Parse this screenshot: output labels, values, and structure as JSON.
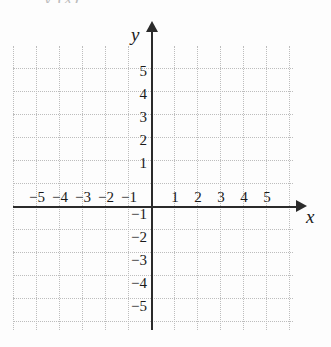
{
  "figure": {
    "type": "coordinate-grid",
    "width": 331,
    "height": 347,
    "background_color": "#fdfdfd",
    "grid_color": "#bdbdbd",
    "axis_color": "#2b2b2b",
    "top_fragment_text": "y (x)"
  },
  "axes": {
    "x_name": "x",
    "y_name": "y",
    "x_arrow_icon": "arrow-right-icon",
    "y_arrow_icon": "arrow-up-icon"
  },
  "chart_data": {
    "type": "scatter",
    "title": "",
    "xlabel": "x",
    "ylabel": "y",
    "xlim": [
      -6,
      6
    ],
    "ylim": [
      -6,
      6
    ],
    "grid": true,
    "legend": null,
    "series": [],
    "x_ticks": [
      -5,
      -4,
      -3,
      -2,
      -1,
      1,
      2,
      3,
      4,
      5
    ],
    "y_ticks": [
      5,
      4,
      3,
      2,
      1,
      -1,
      -2,
      -3,
      -4,
      -5
    ],
    "x_tick_labels": [
      "−5",
      "−4",
      "−3",
      "−2",
      "−1",
      "1",
      "2",
      "3",
      "4",
      "5"
    ],
    "y_tick_labels": [
      "5",
      "4",
      "3",
      "2",
      "1",
      "−1",
      "−2",
      "−3",
      "−4",
      "−5"
    ],
    "origin_label": "",
    "gridline_spacing_units": 1
  },
  "ticks": {
    "x": [
      {
        "label": "−5",
        "value": -5,
        "px_left": 37,
        "px_top": 190
      },
      {
        "label": "−4",
        "value": -4,
        "px_left": 60,
        "px_top": 190
      },
      {
        "label": "−3",
        "value": -3,
        "px_left": 83,
        "px_top": 190
      },
      {
        "label": "−2",
        "value": -2,
        "px_left": 106,
        "px_top": 190
      },
      {
        "label": "−1",
        "value": -1,
        "px_left": 129,
        "px_top": 190
      },
      {
        "label": "1",
        "value": 1,
        "px_left": 175,
        "px_top": 190
      },
      {
        "label": "2",
        "value": 2,
        "px_left": 198,
        "px_top": 190
      },
      {
        "label": "3",
        "value": 3,
        "px_left": 221,
        "px_top": 190
      },
      {
        "label": "4",
        "value": 4,
        "px_left": 244,
        "px_top": 190
      },
      {
        "label": "5",
        "value": 5,
        "px_left": 267,
        "px_top": 190
      }
    ],
    "y": [
      {
        "label": "5",
        "value": 5,
        "px_right": 147,
        "px_top": 71
      },
      {
        "label": "4",
        "value": 4,
        "px_right": 147,
        "px_top": 94
      },
      {
        "label": "3",
        "value": 3,
        "px_right": 147,
        "px_top": 117
      },
      {
        "label": "2",
        "value": 2,
        "px_right": 147,
        "px_top": 140
      },
      {
        "label": "1",
        "value": 1,
        "px_right": 147,
        "px_top": 163
      },
      {
        "label": "−1",
        "value": -1,
        "px_right": 147,
        "px_top": 214
      },
      {
        "label": "−2",
        "value": -2,
        "px_right": 147,
        "px_top": 237
      },
      {
        "label": "−3",
        "value": -3,
        "px_right": 147,
        "px_top": 260
      },
      {
        "label": "−4",
        "value": -4,
        "px_right": 147,
        "px_top": 283
      },
      {
        "label": "−5",
        "value": -5,
        "px_right": 147,
        "px_top": 306
      }
    ]
  }
}
